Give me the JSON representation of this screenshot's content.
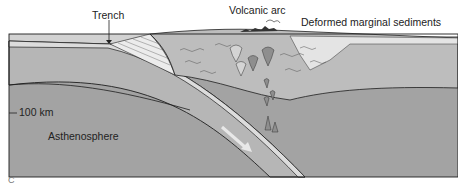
{
  "diagram": {
    "labels": {
      "trench": "Trench",
      "volcanic_arc": "Volcanic arc",
      "deformed_sediments": "Deformed marginal sediments",
      "depth_marker": "100 km",
      "asthenosphere": "Asthenosphere",
      "figure_letter": "C"
    },
    "colors": {
      "background": "#ffffff",
      "asthenosphere": "#a3a3a3",
      "lithosphere": "#b4b4b4",
      "ocean": "#cfcfcf",
      "crust_light": "#e2e2e2",
      "continental": "#bdbdbd",
      "magma": "#8e8e8e",
      "outline": "#1e1e1e",
      "motion_arrow": "#e8e8e8"
    }
  }
}
